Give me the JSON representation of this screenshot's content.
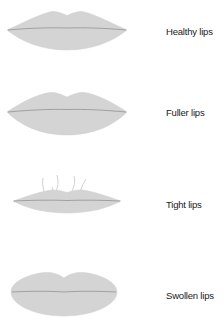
{
  "colors": {
    "lip_fill": "#d4d4d4",
    "lip_line": "#9a9a9a",
    "wisp": "#c4c4c4",
    "label": "#1a1a1a"
  },
  "items": [
    {
      "id": "healthy",
      "label": "Healthy lips"
    },
    {
      "id": "fuller",
      "label": "Fuller lips"
    },
    {
      "id": "tight",
      "label": "Tight lips"
    },
    {
      "id": "swollen",
      "label": "Swollen lips"
    }
  ]
}
